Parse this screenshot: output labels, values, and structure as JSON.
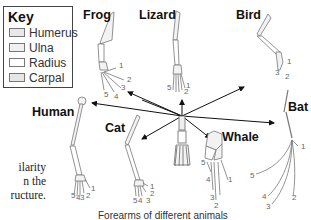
{
  "key": {
    "title": "Key",
    "items": [
      {
        "label": "Humerus",
        "color": "#e8e8e8"
      },
      {
        "label": "Ulna",
        "color": "#f0f0f0"
      },
      {
        "label": "Radius",
        "color": "#ffffff"
      },
      {
        "label": "Carpal",
        "color": "#e6e6e6"
      }
    ]
  },
  "animals": {
    "frog": "Frog",
    "lizard": "Lizard",
    "bird": "Bird",
    "human": "Human",
    "cat": "Cat",
    "whale": "Whale",
    "bat": "Bat"
  },
  "side_text": {
    "line1": "ilarity",
    "line2": "n the",
    "line3": "ructure."
  },
  "caption": "Forearms of different animals",
  "digit_labels": [
    "1",
    "2",
    "3",
    "4",
    "5"
  ]
}
